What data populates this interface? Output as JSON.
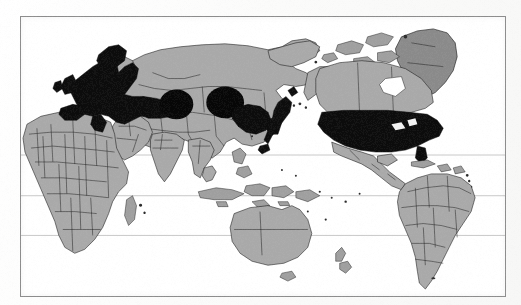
{
  "figure": {
    "type": "world-map",
    "title": "",
    "caption": "",
    "frame": {
      "border_color": "#8c8c8c",
      "background": "#ffffff"
    }
  },
  "legend": {
    "highlighted_label": "",
    "highlighted_color": "#0c0c0c",
    "base_label": "",
    "base_color": "#a9a9a9"
  },
  "graticule": {
    "visible": true,
    "color": "#9a9a9a",
    "latitude_lines": [
      155,
      196,
      236
    ],
    "longitude_lines": []
  },
  "regions_highlighted": [
    {
      "name": "Western Europe",
      "fill": "#0c0c0c"
    },
    {
      "name": "Scandinavia",
      "fill": "#0c0c0c"
    },
    {
      "name": "United Kingdom and Ireland",
      "fill": "#0c0c0c"
    },
    {
      "name": "Eastern Europe",
      "fill": "#0c0c0c"
    },
    {
      "name": "Central Asia blob",
      "fill": "#070707"
    },
    {
      "name": "Siberia blob",
      "fill": "#070707"
    },
    {
      "name": "Northeast China and Korea",
      "fill": "#0c0c0c"
    },
    {
      "name": "Japan",
      "fill": "#0d0d0d"
    },
    {
      "name": "United States of America",
      "fill": "#0c0c0c"
    }
  ],
  "regions_base": [
    {
      "name": "Canada",
      "fill": "#a9a9a9"
    },
    {
      "name": "Alaska",
      "fill": "#a9a9a9"
    },
    {
      "name": "Greenland",
      "fill": "#8a8a8a"
    },
    {
      "name": "Mexico and Central America",
      "fill": "#a9a9a9"
    },
    {
      "name": "South America",
      "fill": "#a9a9a9"
    },
    {
      "name": "Africa",
      "fill": "#a9a9a9"
    },
    {
      "name": "Russia",
      "fill": "#a9a9a9"
    },
    {
      "name": "Middle East",
      "fill": "#a9a9a9"
    },
    {
      "name": "India and South Asia",
      "fill": "#a9a9a9"
    },
    {
      "name": "Southeast Asia",
      "fill": "#a9a9a9"
    },
    {
      "name": "Indonesia and Philippines",
      "fill": "#a9a9a9"
    },
    {
      "name": "Australia",
      "fill": "#a9a9a9"
    },
    {
      "name": "New Zealand",
      "fill": "#a9a9a9"
    },
    {
      "name": "Madagascar",
      "fill": "#a9a9a9"
    },
    {
      "name": "Caribbean islands",
      "fill": "#a9a9a9"
    }
  ]
}
